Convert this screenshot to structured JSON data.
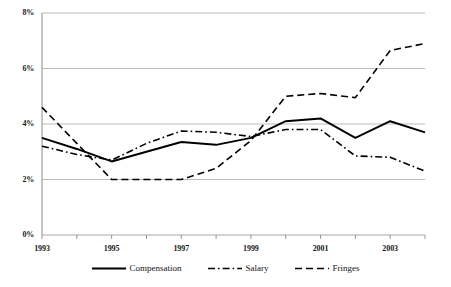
{
  "chart_data": {
    "type": "line",
    "title": "",
    "subtitle": "",
    "xlabel": "",
    "ylabel": "",
    "x": [
      1993,
      1994,
      1995,
      1996,
      1997,
      1998,
      1999,
      2000,
      2001,
      2002,
      2003,
      2004
    ],
    "xlim": [
      1993,
      2004
    ],
    "ylim": [
      0,
      8
    ],
    "ytick_values": [
      0,
      2,
      4,
      6,
      8
    ],
    "ytick_labels": [
      "0%",
      "2%",
      "4%",
      "6%",
      "8%"
    ],
    "xtick_values": [
      1993,
      1995,
      1997,
      1999,
      2001,
      2003
    ],
    "xtick_labels": [
      "1993",
      "1995",
      "1997",
      "1999",
      "2001",
      "2003"
    ],
    "grid": "horizontal",
    "legend_position": "bottom",
    "series": [
      {
        "name": "Compensation",
        "style": "solid",
        "color": "#000000",
        "values": [
          3.5,
          3.1,
          2.65,
          3.0,
          3.35,
          3.25,
          3.5,
          4.1,
          4.2,
          3.5,
          4.1,
          3.7
        ]
      },
      {
        "name": "Salary",
        "style": "dash-dot",
        "color": "#000000",
        "values": [
          3.2,
          2.9,
          2.7,
          3.3,
          3.75,
          3.7,
          3.55,
          3.8,
          3.8,
          2.85,
          2.8,
          2.3
        ]
      },
      {
        "name": "Fringes",
        "style": "dashed",
        "color": "#000000",
        "values": [
          4.6,
          3.3,
          2.0,
          2.0,
          2.0,
          2.4,
          3.4,
          5.0,
          5.1,
          4.95,
          6.65,
          6.9
        ]
      }
    ]
  },
  "legend": {
    "items": [
      {
        "label": "Compensation",
        "icon": "solid-line-swatch"
      },
      {
        "label": "Salary",
        "icon": "dash-dot-line-swatch"
      },
      {
        "label": "Fringes",
        "icon": "dashed-line-swatch"
      }
    ]
  }
}
